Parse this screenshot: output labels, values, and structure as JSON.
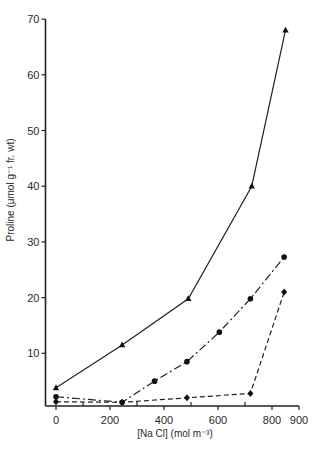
{
  "chart_data": {
    "type": "line",
    "title": "",
    "xlabel": "[Na Cl]  (mol m⁻³)",
    "ylabel": "Proline (μmol g⁻¹ fr. wt)",
    "xlim": [
      0,
      900
    ],
    "ylim": [
      0,
      70
    ],
    "x_ticks": [
      0,
      200,
      400,
      600,
      800,
      900
    ],
    "x_minor_ticks": [
      100,
      300,
      500,
      700
    ],
    "y_ticks": [
      10,
      20,
      30,
      40,
      50,
      60,
      70
    ],
    "grid": false,
    "legend": "none",
    "series": [
      {
        "name": "triangle-solid",
        "marker": "triangle",
        "line_style": "solid",
        "points": [
          [
            0,
            3.8
          ],
          [
            245,
            11.5
          ],
          [
            490,
            19.8
          ],
          [
            725,
            40.0
          ],
          [
            850,
            68.0
          ]
        ]
      },
      {
        "name": "circle-dashdot",
        "marker": "circle",
        "line_style": "dash-dot",
        "points": [
          [
            0,
            2.2
          ],
          [
            245,
            1.2
          ],
          [
            365,
            5.0
          ],
          [
            485,
            8.5
          ],
          [
            605,
            13.8
          ],
          [
            720,
            19.8
          ],
          [
            845,
            27.3
          ]
        ]
      },
      {
        "name": "diamond-dashed",
        "marker": "diamond",
        "line_style": "dashed",
        "points": [
          [
            0,
            1.3
          ],
          [
            245,
            1.2
          ],
          [
            485,
            2.0
          ],
          [
            720,
            2.8
          ],
          [
            845,
            21.0
          ]
        ]
      }
    ]
  }
}
